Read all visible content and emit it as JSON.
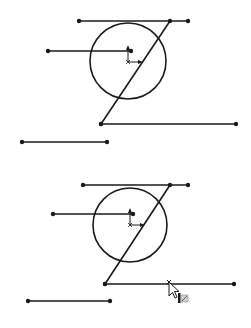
{
  "figure": {
    "width": 251,
    "height": 328,
    "background": "#ffffff",
    "stroke_color": "#1a1a1a",
    "panels": [
      {
        "id": "before",
        "lines": [
          {
            "name": "top-line",
            "x1": 79,
            "y1": 21,
            "x2": 188,
            "y2": 21
          },
          {
            "name": "left-line",
            "x1": 48,
            "y1": 51,
            "x2": 131,
            "y2": 51
          },
          {
            "name": "diagonal-line",
            "x1": 170,
            "y1": 21,
            "x2": 101,
            "y2": 124
          },
          {
            "name": "bottom-right-line",
            "x1": 101,
            "y1": 124,
            "x2": 236,
            "y2": 124
          },
          {
            "name": "lower-left-line",
            "x1": 22,
            "y1": 142,
            "x2": 107,
            "y2": 142
          }
        ],
        "circle": {
          "cx": 128,
          "cy": 61,
          "r": 38
        },
        "origin": {
          "x": 128,
          "y": 62
        }
      },
      {
        "id": "after",
        "lines": [
          {
            "name": "top-line",
            "x1": 83,
            "y1": 185,
            "x2": 188,
            "y2": 185
          },
          {
            "name": "left-line",
            "x1": 53,
            "y1": 214,
            "x2": 133,
            "y2": 214
          },
          {
            "name": "diagonal-line",
            "x1": 170,
            "y1": 185,
            "x2": 105,
            "y2": 284
          },
          {
            "name": "bottom-right-line",
            "x1": 105,
            "y1": 284,
            "x2": 234,
            "y2": 284
          },
          {
            "name": "lower-left-line",
            "x1": 28,
            "y1": 301,
            "x2": 110,
            "y2": 301
          }
        ],
        "circle": {
          "cx": 130,
          "cy": 225,
          "r": 37
        },
        "origin": {
          "x": 130,
          "y": 225
        },
        "cursor": {
          "x": 169,
          "y": 284,
          "type": "trim-entities-pointer"
        }
      }
    ]
  }
}
